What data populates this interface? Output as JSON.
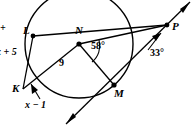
{
  "figure": {
    "type": "circle-geometry-diagram",
    "background_color": "#ffffff",
    "stroke_color": "#000000",
    "points": {
      "L": {
        "label": "L",
        "x": 33,
        "y": 36,
        "on_circle": true,
        "dot": true
      },
      "N": {
        "label": "N",
        "x": 79,
        "y": 44,
        "is_center": true,
        "dot": true
      },
      "M": {
        "label": "M",
        "x": 114,
        "y": 85,
        "on_circle": true,
        "dot": true
      },
      "K": {
        "label": "K",
        "x": 23,
        "y": 89,
        "on_circle": false,
        "dot": false
      },
      "P": {
        "label": "P",
        "x": 167,
        "y": 25,
        "on_circle": false,
        "dot": true
      }
    },
    "circle": {
      "center_x": 79,
      "center_y": 44,
      "radius": 54
    },
    "angles": [
      {
        "label": "58°",
        "vertex": "N",
        "x": 94,
        "y": 46
      },
      {
        "label": "33°",
        "vertex": "P",
        "x": 152,
        "y": 53
      }
    ],
    "segment_labels": [
      {
        "label": "9",
        "segment": "KN",
        "x": 61,
        "y": 63
      },
      {
        "label": "x + 5",
        "segment": "KL",
        "x": 0,
        "y": 52,
        "clipped_left": true
      },
      {
        "label": "x − 1",
        "segment": "K-arrow",
        "x": 27,
        "y": 104
      }
    ],
    "clipped_labels": [
      {
        "label": "+",
        "x": 1,
        "y": 27
      }
    ]
  }
}
